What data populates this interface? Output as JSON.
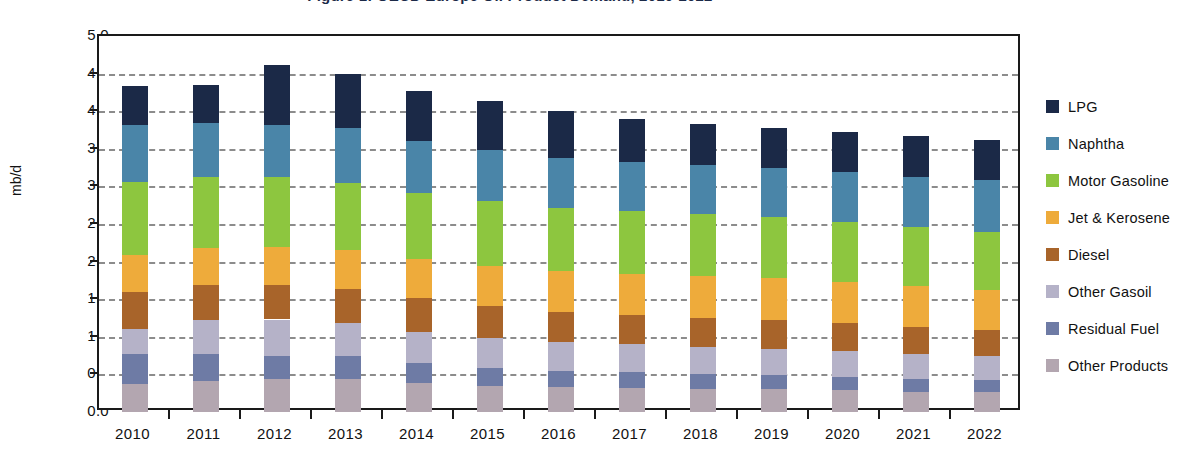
{
  "chart_data": {
    "type": "bar",
    "stacked": true,
    "title": "Figure 1: OECD Europe Oil Product Demand, 2010-2022",
    "ylabel": "mb/d",
    "xlabel": "",
    "ylim": [
      0.0,
      5.0
    ],
    "ytick_step": 0.5,
    "grid": true,
    "legend_position": "right",
    "ytick_labels": [
      "5.0",
      "4.5",
      "4.0",
      "3.5",
      "3.0",
      "2.5",
      "2.0",
      "1.5",
      "1.0",
      "0.5",
      "0.0"
    ],
    "categories": [
      "2010",
      "2011",
      "2012",
      "2013",
      "2014",
      "2015",
      "2016",
      "2017",
      "2018",
      "2019",
      "2020",
      "2021",
      "2022"
    ],
    "series": [
      {
        "name": "Other Products",
        "color": "#b3a6b0",
        "values": [
          0.37,
          0.41,
          0.44,
          0.44,
          0.38,
          0.35,
          0.33,
          0.32,
          0.31,
          0.3,
          0.29,
          0.27,
          0.26
        ]
      },
      {
        "name": "Residual Fuel",
        "color": "#6e7ba5",
        "values": [
          0.4,
          0.36,
          0.31,
          0.3,
          0.27,
          0.24,
          0.22,
          0.21,
          0.2,
          0.19,
          0.18,
          0.17,
          0.16
        ]
      },
      {
        "name": "Other Gasoil",
        "color": "#b5b2c8",
        "values": [
          0.33,
          0.45,
          0.48,
          0.45,
          0.42,
          0.4,
          0.38,
          0.37,
          0.36,
          0.35,
          0.34,
          0.33,
          0.32
        ]
      },
      {
        "name": "Diesel",
        "color": "#a8642a",
        "values": [
          0.5,
          0.47,
          0.46,
          0.45,
          0.44,
          0.42,
          0.4,
          0.39,
          0.38,
          0.38,
          0.37,
          0.36,
          0.35
        ]
      },
      {
        "name": "Jet & Kerosene",
        "color": "#eeab3b",
        "values": [
          0.49,
          0.49,
          0.5,
          0.51,
          0.52,
          0.53,
          0.54,
          0.55,
          0.56,
          0.56,
          0.55,
          0.54,
          0.53
        ]
      },
      {
        "name": "Motor Gasoline",
        "color": "#8dc63f",
        "values": [
          0.97,
          0.94,
          0.93,
          0.9,
          0.88,
          0.86,
          0.84,
          0.83,
          0.82,
          0.81,
          0.8,
          0.79,
          0.78
        ]
      },
      {
        "name": "Naphtha",
        "color": "#4a85a8",
        "values": [
          0.75,
          0.72,
          0.7,
          0.72,
          0.7,
          0.69,
          0.67,
          0.66,
          0.66,
          0.66,
          0.66,
          0.67,
          0.68
        ]
      },
      {
        "name": "LPG",
        "color": "#1b2947",
        "values": [
          0.52,
          0.51,
          0.8,
          0.73,
          0.66,
          0.64,
          0.62,
          0.57,
          0.54,
          0.52,
          0.54,
          0.54,
          0.54
        ]
      }
    ],
    "totals": [
      4.33,
      4.35,
      4.62,
      4.5,
      4.27,
      4.13,
      4.0,
      3.9,
      3.83,
      3.77,
      3.73,
      3.67,
      3.62
    ]
  }
}
